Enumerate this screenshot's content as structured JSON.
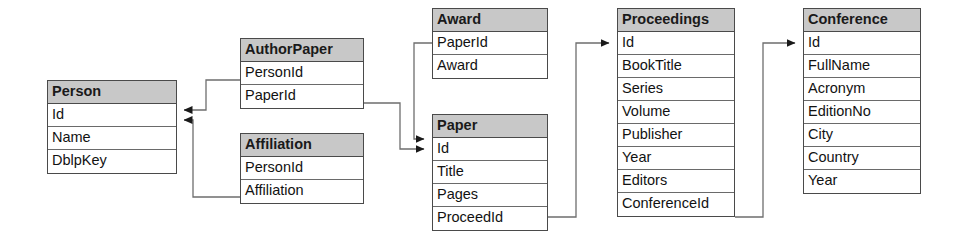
{
  "diagram": {
    "type": "er-diagram",
    "colors": {
      "header_fill": "#c8c8c8",
      "body_fill": "#ffffff",
      "border": "#4a4a4a",
      "connector": "#6e6e6e",
      "text": "#121212"
    },
    "entities": [
      {
        "id": "person",
        "name": "Person",
        "attributes": [
          "Id",
          "Name",
          "DblpKey"
        ],
        "x": 47,
        "y": 80,
        "width": 130
      },
      {
        "id": "authorpaper",
        "name": "AuthorPaper",
        "attributes": [
          "PersonId",
          "PaperId"
        ],
        "x": 240,
        "y": 38,
        "width": 124
      },
      {
        "id": "affiliation",
        "name": "Affiliation",
        "attributes": [
          "PersonId",
          "Affiliation"
        ],
        "x": 240,
        "y": 133,
        "width": 124
      },
      {
        "id": "award",
        "name": "Award",
        "attributes": [
          "PaperId",
          "Award"
        ],
        "x": 432,
        "y": 8,
        "width": 116
      },
      {
        "id": "paper",
        "name": "Paper",
        "attributes": [
          "Id",
          "Title",
          "Pages",
          "ProceedId"
        ],
        "x": 432,
        "y": 114,
        "width": 116
      },
      {
        "id": "proceedings",
        "name": "Proceedings",
        "attributes": [
          "Id",
          "BookTitle",
          "Series",
          "Volume",
          "Publisher",
          "Year",
          "Editors",
          "ConferenceId"
        ],
        "x": 617,
        "y": 8,
        "width": 118
      },
      {
        "id": "conference",
        "name": "Conference",
        "attributes": [
          "Id",
          "FullName",
          "Acronym",
          "EditionNo",
          "City",
          "Country",
          "Year"
        ],
        "x": 803,
        "y": 8,
        "width": 118
      }
    ],
    "relationships": [
      {
        "id": "authorpaper-personid-to-person-id",
        "from_entity": "AuthorPaper",
        "from_attribute": "PersonId",
        "to_entity": "Person",
        "to_attribute": "Id",
        "arrow_at": "Person.Id"
      },
      {
        "id": "affiliation-personid-to-person-id",
        "from_entity": "Affiliation",
        "from_attribute": "PersonId",
        "to_entity": "Person",
        "to_attribute": "Id",
        "arrow_at": "Person.Id"
      },
      {
        "id": "authorpaper-paperid-to-paper-id",
        "from_entity": "AuthorPaper",
        "from_attribute": "PaperId",
        "to_entity": "Paper",
        "to_attribute": "Id",
        "arrow_at": "Paper.Id"
      },
      {
        "id": "award-paperid-to-paper-id",
        "from_entity": "Award",
        "from_attribute": "PaperId",
        "to_entity": "Paper",
        "to_attribute": "Id",
        "arrow_at": "Paper.Id"
      },
      {
        "id": "paper-proceedid-to-proceedings-id",
        "from_entity": "Paper",
        "from_attribute": "ProceedId",
        "to_entity": "Proceedings",
        "to_attribute": "Id",
        "arrow_at": "Proceedings.Id"
      },
      {
        "id": "proceedings-conferenceid-to-conference-id",
        "from_entity": "Proceedings",
        "from_attribute": "ConferenceId",
        "to_entity": "Conference",
        "to_attribute": "Id",
        "arrow_at": "Conference.Id"
      }
    ]
  }
}
